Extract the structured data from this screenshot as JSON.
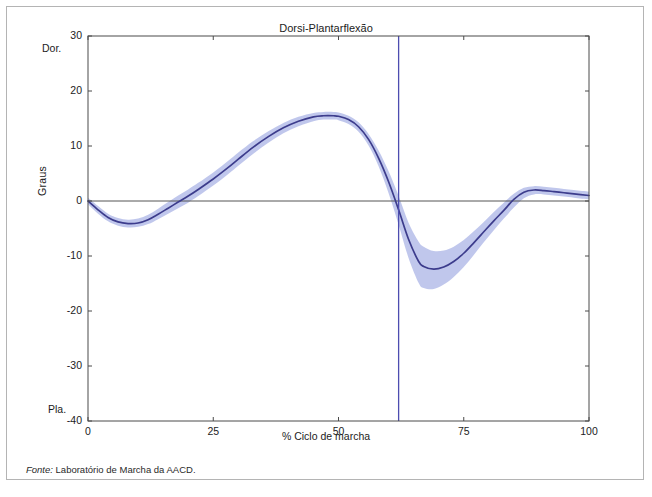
{
  "figure": {
    "title": "Dorsi-Plantarflexão",
    "source_note_prefix": "Fonte:",
    "source_note_text": " Laboratório de Marcha da AACD."
  },
  "axes": {
    "ylabel": "Graus",
    "xlabel": "% Ciclo de marcha",
    "y_top_annotation": "Dor.",
    "y_bottom_annotation": "Pla.",
    "yticks": [
      "30",
      "20",
      "10",
      "0",
      "-10",
      "-20",
      "-30",
      "-40"
    ],
    "xticks": [
      "0",
      "25",
      "50",
      "75",
      "100"
    ]
  },
  "colors": {
    "curve": "#3c3c8c",
    "band": "#b9c1ea",
    "event_line": "#4d4db0",
    "axis": "#4a4a4a",
    "zero_line": "#555555",
    "frame": "#b4b4b4",
    "text": "#1c1c1c"
  },
  "chart_data": {
    "type": "line",
    "title": "Dorsi-Plantarflexão",
    "xlabel": "% Ciclo de marcha",
    "ylabel": "Graus",
    "xlim": [
      0,
      100
    ],
    "ylim": [
      -40,
      30
    ],
    "xticks": [
      0,
      25,
      50,
      75,
      100
    ],
    "yticks": [
      30,
      20,
      10,
      0,
      -10,
      -20,
      -30,
      -40
    ],
    "grid": false,
    "legend": "none",
    "annotations": [
      {
        "text": "Dor.",
        "position": "y-axis-top",
        "meaning": "dorsiflexion"
      },
      {
        "text": "Pla.",
        "position": "y-axis-bottom",
        "meaning": "plantarflexion"
      }
    ],
    "reference_lines": [
      {
        "orientation": "horizontal",
        "value": 0,
        "color": "#555555"
      },
      {
        "orientation": "vertical",
        "value": 62,
        "color": "#4d4db0",
        "label": "toe-off"
      }
    ],
    "series": [
      {
        "name": "Média",
        "x": [
          0,
          2,
          4,
          6,
          8,
          10,
          12,
          14,
          16,
          18,
          20,
          22,
          25,
          28,
          30,
          33,
          36,
          39,
          42,
          45,
          47,
          49,
          50,
          52,
          54,
          56,
          58,
          60,
          62,
          64,
          66,
          67,
          69,
          71,
          73,
          75,
          77,
          79,
          81,
          83,
          85,
          87,
          89,
          91,
          93,
          95,
          97,
          100
        ],
        "values": [
          0.0,
          -1.6,
          -3.0,
          -3.8,
          -4.1,
          -4.0,
          -3.4,
          -2.4,
          -1.3,
          -0.2,
          0.9,
          2.1,
          4.0,
          6.1,
          7.6,
          9.8,
          11.7,
          13.3,
          14.5,
          15.3,
          15.5,
          15.5,
          15.4,
          14.8,
          13.5,
          11.2,
          7.8,
          3.5,
          -1.6,
          -7.0,
          -11.0,
          -11.9,
          -12.4,
          -12.0,
          -11.0,
          -9.5,
          -7.6,
          -5.6,
          -3.6,
          -1.7,
          0.3,
          1.6,
          2.0,
          1.9,
          1.7,
          1.5,
          1.3,
          1.0
        ]
      },
      {
        "name": "Desvio superior (+1 DP)",
        "x": [
          0,
          2,
          4,
          6,
          8,
          10,
          12,
          14,
          16,
          18,
          20,
          22,
          25,
          28,
          30,
          33,
          36,
          39,
          42,
          45,
          47,
          49,
          50,
          52,
          54,
          56,
          58,
          60,
          62,
          64,
          66,
          67,
          69,
          71,
          73,
          75,
          77,
          79,
          81,
          83,
          85,
          87,
          89,
          91,
          93,
          95,
          97,
          100
        ],
        "values": [
          0.6,
          -0.9,
          -2.3,
          -3.1,
          -3.4,
          -3.2,
          -2.5,
          -1.4,
          -0.2,
          1.0,
          2.1,
          3.3,
          5.2,
          7.3,
          8.8,
          10.9,
          12.7,
          14.2,
          15.3,
          16.0,
          16.2,
          16.2,
          16.1,
          15.5,
          14.3,
          12.2,
          9.2,
          5.4,
          0.9,
          -4.0,
          -7.4,
          -8.3,
          -9.1,
          -9.0,
          -8.3,
          -7.1,
          -5.5,
          -3.8,
          -2.0,
          -0.3,
          1.3,
          2.4,
          2.7,
          2.6,
          2.4,
          2.2,
          2.0,
          1.7
        ]
      },
      {
        "name": "Desvio inferior (-1 DP)",
        "x": [
          0,
          2,
          4,
          6,
          8,
          10,
          12,
          14,
          16,
          18,
          20,
          22,
          25,
          28,
          30,
          33,
          36,
          39,
          42,
          45,
          47,
          49,
          50,
          52,
          54,
          56,
          58,
          60,
          62,
          64,
          66,
          67,
          69,
          71,
          73,
          75,
          77,
          79,
          81,
          83,
          85,
          87,
          89,
          91,
          93,
          95,
          97,
          100
        ],
        "values": [
          -0.6,
          -2.3,
          -3.7,
          -4.5,
          -4.8,
          -4.7,
          -4.2,
          -3.3,
          -2.3,
          -1.3,
          -0.3,
          0.9,
          2.8,
          4.9,
          6.4,
          8.6,
          10.6,
          12.3,
          13.6,
          14.5,
          14.8,
          14.8,
          14.7,
          14.0,
          12.6,
          10.1,
          6.3,
          1.4,
          -4.3,
          -10.4,
          -14.9,
          -15.8,
          -16.0,
          -15.2,
          -13.8,
          -12.0,
          -9.8,
          -7.5,
          -5.3,
          -3.2,
          -1.2,
          0.5,
          1.2,
          1.2,
          1.0,
          0.8,
          0.6,
          0.3
        ]
      }
    ]
  }
}
